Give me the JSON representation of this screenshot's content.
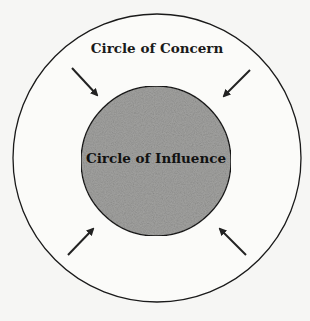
{
  "diagram": {
    "outer_circle": {
      "label": "Circle of Concern",
      "fill": "#fbfbf9",
      "stroke": "#1a1a1a"
    },
    "inner_circle": {
      "label": "Circle of Influence",
      "fill": "#9a9a98",
      "stroke": "#1a1a1a"
    },
    "arrows": [
      {
        "direction": "inward",
        "position": "top-left"
      },
      {
        "direction": "inward",
        "position": "top-right"
      },
      {
        "direction": "inward",
        "position": "bottom-left"
      },
      {
        "direction": "inward",
        "position": "bottom-right"
      }
    ]
  }
}
